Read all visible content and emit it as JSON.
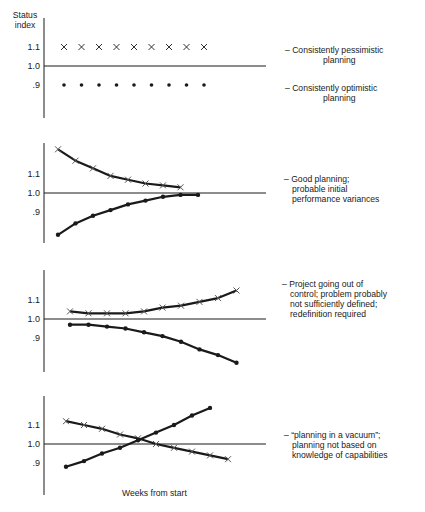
{
  "chart_data": {
    "type": "line",
    "ylabel": "Status index",
    "xlabel": "Weeks from start",
    "grid": false,
    "baseline": 1.0,
    "panels": [
      {
        "title": "Consistently pessimistic/optimistic planning",
        "ticks": [
          "1.1",
          "1.0",
          ".9"
        ],
        "annotations": [
          "– Consistently pessimistic",
          "planning",
          "– Consistently optimistic",
          "planning"
        ],
        "series": [
          {
            "name": "cost (x)",
            "marker": "x",
            "line": false,
            "x": [
              1,
              2,
              3,
              4,
              5,
              6,
              7,
              8,
              9
            ],
            "values": [
              1.1,
              1.1,
              1.1,
              1.1,
              1.1,
              1.1,
              1.1,
              1.1,
              1.1
            ]
          },
          {
            "name": "schedule (dot)",
            "marker": "dot",
            "line": false,
            "x": [
              1,
              2,
              3,
              4,
              5,
              6,
              7,
              8,
              9
            ],
            "values": [
              0.9,
              0.9,
              0.9,
              0.9,
              0.9,
              0.9,
              0.9,
              0.9,
              0.9
            ]
          }
        ]
      },
      {
        "title": "Good planning",
        "ticks": [
          "1.1",
          "1.0",
          ".9"
        ],
        "annotations": [
          "– Good planning;",
          "probable initial",
          "performance variances"
        ],
        "series": [
          {
            "name": "cost (x)",
            "marker": "x",
            "line": true,
            "x": [
              1,
              2,
              3,
              4,
              5,
              6,
              7,
              8
            ],
            "values": [
              1.23,
              1.17,
              1.13,
              1.09,
              1.07,
              1.05,
              1.04,
              1.03
            ]
          },
          {
            "name": "schedule (dot)",
            "marker": "dot",
            "line": true,
            "x": [
              1,
              2,
              3,
              4,
              5,
              6,
              7,
              8,
              9
            ],
            "values": [
              0.78,
              0.84,
              0.88,
              0.91,
              0.94,
              0.96,
              0.98,
              0.99,
              0.99
            ]
          }
        ]
      },
      {
        "title": "Project going out of control",
        "ticks": [
          "1.1",
          "1.0",
          ".9"
        ],
        "annotations": [
          "– Project going out of",
          "control; problem probably",
          "not sufficiently defined;",
          "redefinition required"
        ],
        "series": [
          {
            "name": "cost (x)",
            "marker": "x",
            "line": true,
            "x": [
              1,
              2,
              3,
              4,
              5,
              6,
              7,
              8,
              9,
              10,
              11
            ],
            "values": [
              1.04,
              1.03,
              1.03,
              1.03,
              1.04,
              1.06,
              1.07,
              1.09,
              1.11,
              1.15
            ]
          },
          {
            "name": "schedule (dot)",
            "marker": "dot",
            "line": true,
            "x": [
              1,
              2,
              3,
              4,
              5,
              6,
              7,
              8,
              9,
              10
            ],
            "values": [
              0.97,
              0.97,
              0.96,
              0.95,
              0.93,
              0.91,
              0.88,
              0.84,
              0.81,
              0.77
            ]
          }
        ]
      },
      {
        "title": "Planning in a vacuum",
        "ticks": [
          "1.1",
          "1.0",
          ".9"
        ],
        "annotations": [
          "– “planning in a vacuum”;",
          "planning not based on",
          "knowledge of capabilities"
        ],
        "series": [
          {
            "name": "cost (x)",
            "marker": "x",
            "line": true,
            "x": [
              1,
              2,
              3,
              4,
              5,
              6,
              7,
              8,
              9,
              10,
              11
            ],
            "values": [
              1.12,
              1.1,
              1.08,
              1.05,
              1.03,
              1.0,
              0.98,
              0.96,
              0.94,
              0.92
            ]
          },
          {
            "name": "schedule (dot)",
            "marker": "dot",
            "line": true,
            "x": [
              1,
              2,
              3,
              4,
              5,
              6,
              7,
              8,
              9
            ],
            "values": [
              0.88,
              0.91,
              0.95,
              0.98,
              1.02,
              1.06,
              1.1,
              1.15,
              1.19
            ]
          }
        ]
      }
    ]
  },
  "labels": {
    "ylabel_line1": "Status",
    "ylabel_line2": "index",
    "xlabel": "Weeks from start",
    "tick_hi": "1.1",
    "tick_mid": "1.0",
    "tick_lo": ".9",
    "p1_a1": "– Consistently pessimistic",
    "p1_a2": "planning",
    "p1_b1": "– Consistently optimistic",
    "p1_b2": "planning",
    "p2_1": "– Good planning;",
    "p2_2": "probable initial",
    "p2_3": "performance variances",
    "p3_1": "– Project going out of",
    "p3_2": "control; problem probably",
    "p3_3": "not sufficiently defined;",
    "p3_4": "redefinition required",
    "p4_1": "– “planning in a vacuum”;",
    "p4_2": "planning not based on",
    "p4_3": "knowledge of capabilities"
  },
  "colors": {
    "ink": "#1a1a1a",
    "background": "#ffffff"
  }
}
